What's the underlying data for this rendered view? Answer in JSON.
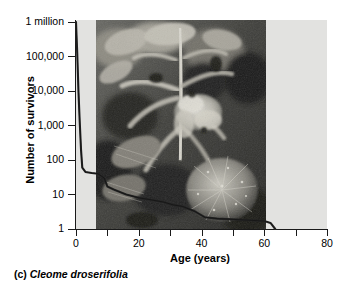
{
  "caption": {
    "index": "(c)",
    "species": "Cleome droserifolia"
  },
  "chart_data": {
    "type": "line",
    "title": "",
    "subtitle": "",
    "xlabel": "Age (years)",
    "ylabel": "Number of survivors",
    "xlim": [
      0,
      80
    ],
    "ylim": [
      1,
      1000000
    ],
    "yscale": "log",
    "xscale": "linear",
    "grid": false,
    "legend": null,
    "x_ticks": [
      0,
      20,
      40,
      60,
      80
    ],
    "x_tick_labels": [
      "0",
      "20",
      "40",
      "60",
      "80"
    ],
    "x_minor_ticks": [
      10,
      30,
      50,
      70
    ],
    "y_ticks": [
      1,
      10,
      100,
      1000,
      10000,
      100000,
      1000000
    ],
    "y_tick_labels": [
      "1",
      "10",
      "100",
      "1,000",
      "10,000",
      "100,000",
      "1 million"
    ],
    "series": [
      {
        "name": "Cleome droserifolia survivorship",
        "curve_type": "Type III survivorship",
        "x": [
          0,
          0.4,
          0.8,
          1.2,
          1.6,
          2.0,
          3,
          5,
          7,
          9,
          10,
          12,
          16,
          20,
          24,
          28,
          31,
          34,
          38,
          41,
          45,
          50,
          55,
          60,
          62,
          63.5
        ],
        "y": [
          1000000,
          120000,
          9000,
          1200,
          200,
          60,
          45,
          42,
          40,
          30,
          17,
          14,
          10,
          8,
          7,
          6,
          5,
          4.5,
          3.2,
          2.2,
          2.0,
          1.9,
          1.8,
          1.7,
          1.5,
          1
        ]
      }
    ],
    "annotations": [
      {
        "text": "photograph of Cleome droserifolia plant overlaid on plot area",
        "x_range": [
          6.4,
          60.5
        ],
        "y_range": [
          1,
          1000000
        ]
      }
    ],
    "colors": {
      "plot_background": "#e2e2e0",
      "axis": "#1a1a1a",
      "curve": "#2b2b2b",
      "page_background": "#ffffff"
    }
  }
}
